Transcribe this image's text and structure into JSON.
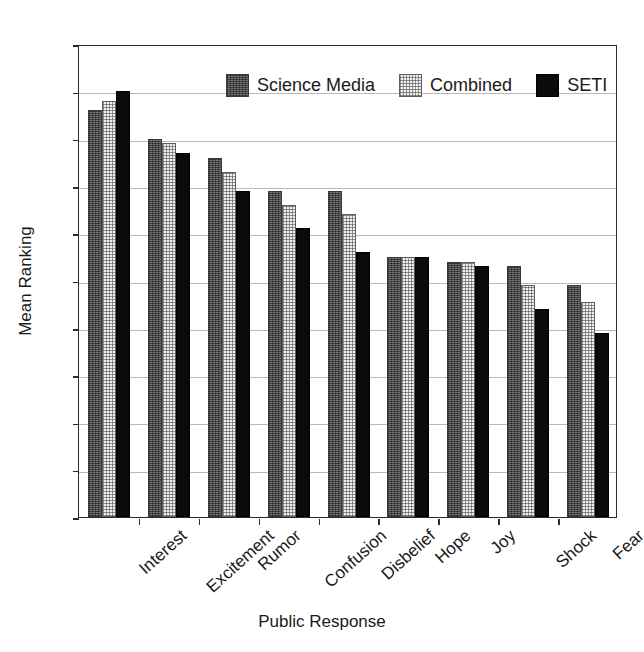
{
  "chart_data": {
    "type": "bar",
    "title": "",
    "xlabel": "Public Response",
    "ylabel": "Mean Ranking",
    "ylim": [
      0,
      10
    ],
    "ytick_labels": [
      "0",
      "1",
      "2",
      "3",
      "4",
      "5",
      "6",
      "7",
      "8",
      "9",
      "10"
    ],
    "yticks": [
      0,
      1,
      2,
      3,
      4,
      5,
      6,
      7,
      8,
      9,
      10
    ],
    "grid": true,
    "legend_position": "top-center-inside",
    "categories": [
      "Interest",
      "Excitement",
      "Rumor",
      "Confusion",
      "Disbelief",
      "Hope",
      "Joy",
      "Shock",
      "Fear"
    ],
    "series": [
      {
        "name": "Science Media",
        "color": "#58585a",
        "pattern": "dark-textured",
        "values": [
          8.6,
          8.0,
          7.6,
          6.9,
          6.9,
          5.5,
          5.4,
          5.3,
          4.9
        ]
      },
      {
        "name": "Combined",
        "color": "#f0f0ee",
        "pattern": "light-dotted",
        "values": [
          8.8,
          7.9,
          7.3,
          6.6,
          6.4,
          5.5,
          5.4,
          4.9,
          4.55
        ]
      },
      {
        "name": "SETI",
        "color": "#0b0b0b",
        "pattern": "solid-black",
        "values": [
          9.0,
          7.7,
          6.9,
          6.1,
          5.6,
          5.5,
          5.3,
          4.4,
          3.9
        ]
      }
    ]
  }
}
